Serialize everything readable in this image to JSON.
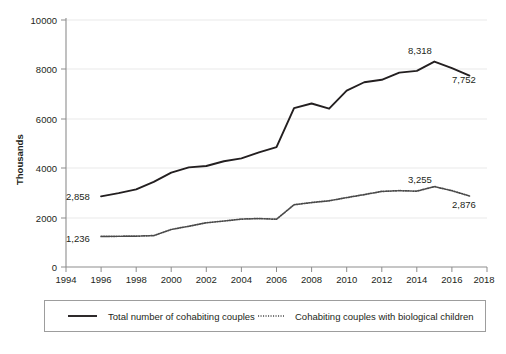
{
  "chart_data": {
    "type": "line",
    "title": "",
    "xlabel": "",
    "ylabel": "Thousands",
    "xlim": [
      1994,
      2018
    ],
    "ylim": [
      0,
      10000
    ],
    "xticks": [
      "1994",
      "1996",
      "1998",
      "2000",
      "2002",
      "2004",
      "2006",
      "2008",
      "2010",
      "2012",
      "2014",
      "2016",
      "2018"
    ],
    "yticks": [
      "0",
      "2000",
      "4000",
      "6000",
      "8000",
      "10000"
    ],
    "grid": "horizontal",
    "legend_position": "bottom",
    "x": [
      1996,
      1997,
      1998,
      1999,
      2000,
      2001,
      2002,
      2003,
      2004,
      2005,
      2006,
      2007,
      2008,
      2009,
      2010,
      2011,
      2012,
      2013,
      2014,
      2015,
      2016,
      2017
    ],
    "series": [
      {
        "name": "Total number of cohabiting couples",
        "style": "solid",
        "values": [
          2858,
          2990,
          3140,
          3450,
          3820,
          4035,
          4090,
          4280,
          4400,
          4640,
          4850,
          6430,
          6620,
          6410,
          7140,
          7480,
          7580,
          7870,
          7940,
          8318,
          8050,
          7752
        ]
      },
      {
        "name": "Cohabiting couples with biological children",
        "style": "dotted",
        "values": [
          1236,
          1245,
          1250,
          1270,
          1520,
          1650,
          1790,
          1860,
          1940,
          1960,
          1935,
          2520,
          2610,
          2680,
          2810,
          2930,
          3060,
          3090,
          3070,
          3255,
          3090,
          2876
        ]
      }
    ],
    "point_labels": [
      {
        "id": "solid-start",
        "text": "2,858",
        "x": 1996,
        "y": 2858
      },
      {
        "id": "solid-peak",
        "text": "8,318",
        "x": 2015,
        "y": 8318
      },
      {
        "id": "solid-end",
        "text": "7,752",
        "x": 2017,
        "y": 7752
      },
      {
        "id": "dotted-start",
        "text": "1,236",
        "x": 1996,
        "y": 1236
      },
      {
        "id": "dotted-peak",
        "text": "3,255",
        "x": 2015,
        "y": 3255
      },
      {
        "id": "dotted-end",
        "text": "2,876",
        "x": 2017,
        "y": 2876
      }
    ],
    "legend": [
      {
        "label": "Total number of cohabiting couples",
        "style": "solid"
      },
      {
        "label": "Cohabiting couples with biological children",
        "style": "dotted"
      }
    ]
  },
  "axis": {
    "y_title": "Thousands",
    "y_ticks": [
      "10000",
      "8000",
      "6000",
      "4000",
      "2000",
      "0"
    ],
    "x_ticks": [
      "1994",
      "1996",
      "1998",
      "2000",
      "2002",
      "2004",
      "2006",
      "2008",
      "2010",
      "2012",
      "2014",
      "2016",
      "2018"
    ]
  },
  "labels": {
    "solid_start": "2,858",
    "solid_peak": "8,318",
    "solid_end": "7,752",
    "dotted_start": "1,236",
    "dotted_peak": "3,255",
    "dotted_end": "2,876"
  },
  "legend": {
    "entry_1": "Total number of cohabiting couples",
    "entry_2": "Cohabiting couples with biological children"
  },
  "colors": {
    "solid_line": "#231f20",
    "dotted_line": "#4a4a4a",
    "gridline": "#e9e9e9",
    "axis": "#8d8d8d",
    "text": "#231f20",
    "background": "#ffffff"
  }
}
